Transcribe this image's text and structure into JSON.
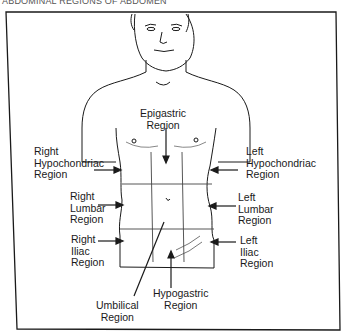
{
  "caption": "ABDOMINAL REGIONS OF ABDOMEN",
  "figure": {
    "labels": {
      "epigastric": [
        "Epigastric",
        "Region"
      ],
      "right_hypochondriac": [
        "Right",
        "Hypochondriac",
        "Region"
      ],
      "left_hypochondriac": [
        "Left",
        "Hypochondriac",
        "Region"
      ],
      "right_lumbar": [
        "Right",
        "Lumbar",
        "Region"
      ],
      "left_lumbar": [
        "Left",
        "Lumbar",
        "Region"
      ],
      "right_iliac": [
        "Right",
        "Iliac",
        "Region"
      ],
      "left_iliac": [
        "Left",
        "Iliac",
        "Region"
      ],
      "umbilical": [
        "Umbilical",
        "Region"
      ],
      "hypogastric": [
        "Hypogastric",
        "Region"
      ]
    }
  },
  "colors": {
    "ink": "#1a1a1a",
    "paper": "#ffffff",
    "grid": "#444444"
  }
}
